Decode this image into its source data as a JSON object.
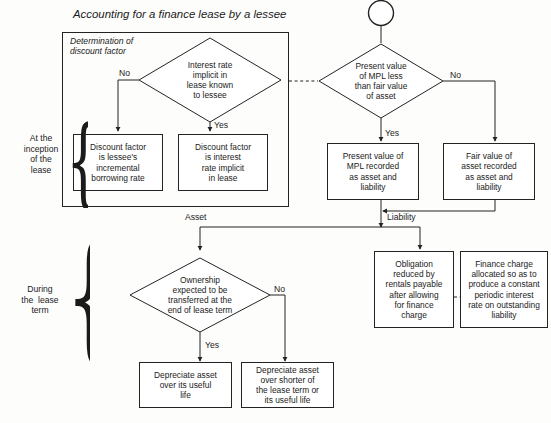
{
  "title": "Accounting for a finance lease by a lessee",
  "group_caption": "Determination of\ndiscount factor",
  "side_labels": [
    {
      "name": "inception",
      "text": "At the\ninception\nof the\nlease"
    },
    {
      "name": "during-term",
      "text": "During\nthe  lease\nterm"
    }
  ],
  "start_node": {
    "shape": "circle",
    "label": ""
  },
  "decisions": [
    {
      "id": "interest-rate-known",
      "label": "Interest rate\nimplicit in\nlease known\nto lessee"
    },
    {
      "id": "pv-mpl-less-than-fair-value",
      "label": "Present value\nof MPL less\nthan fair value\nof asset"
    },
    {
      "id": "ownership-transferred",
      "label": "Ownership\nexpected to be\ntransferred at the\nend of lease term"
    }
  ],
  "processes": [
    {
      "id": "discount-factor-incremental",
      "label": "Discount factor\nis lessee's\nincremental\nborrowing rate"
    },
    {
      "id": "discount-factor-implicit",
      "label": "Discount factor\nis interest\nrate implicit\nin lease"
    },
    {
      "id": "pv-mpl-recorded",
      "label": "Present value of\nMPL recorded\nas asset and\nliability"
    },
    {
      "id": "fair-value-recorded",
      "label": "Fair value of\nasset recorded\nas asset and\nliability"
    },
    {
      "id": "obligation-reduced",
      "label": "Obligation\nreduced by\nrentals payable\nafter allowing\nfor finance\ncharge"
    },
    {
      "id": "finance-charge-allocated",
      "label": "Finance charge\nallocated so as to\nproduce a constant\nperiodic interest\nrate on outstanding\nliability"
    },
    {
      "id": "depreciate-useful-life",
      "label": "Depreciate asset\nover its useful\nlife"
    },
    {
      "id": "depreciate-shorter",
      "label": "Depreciate asset\nover shorter of\nthe lease term or\nits useful life"
    }
  ],
  "edge_labels": [
    {
      "id": "no-interest-rate",
      "text": "No"
    },
    {
      "id": "yes-interest-rate",
      "text": "Yes"
    },
    {
      "id": "no-pv-mpl",
      "text": "No"
    },
    {
      "id": "yes-pv-mpl",
      "text": "Yes"
    },
    {
      "id": "asset",
      "text": "Asset"
    },
    {
      "id": "liability",
      "text": "Liability"
    },
    {
      "id": "no-ownership",
      "text": "No"
    },
    {
      "id": "yes-ownership",
      "text": "Yes"
    }
  ],
  "colors": {
    "stroke": "#232323",
    "text": "#1b1b1b",
    "background": "#fdfdfc"
  }
}
